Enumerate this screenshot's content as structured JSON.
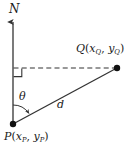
{
  "figure": {
    "background_color": "#ffffff",
    "stroke_color": "#333333",
    "text_color": "#1a1a1a",
    "width": 138,
    "height": 150
  },
  "labels": {
    "north": {
      "text": "N",
      "name": "north-direction-label"
    },
    "point_q": {
      "symbol": "Q",
      "open_paren": "(",
      "x_var": "x",
      "x_sub": "Q",
      "comma": ", ",
      "y_var": "y",
      "y_sub": "Q",
      "close_paren": ")",
      "full_text": "Q(xQ, yQ)"
    },
    "point_p": {
      "symbol": "P",
      "open_paren": "(",
      "x_var": "x",
      "x_sub": "P",
      "comma": ", ",
      "y_var": "y",
      "y_sub": "P",
      "close_paren": ")",
      "full_text": "P(xP, yP)"
    },
    "angle": {
      "text": "θ",
      "name": "bearing-angle-theta"
    },
    "distance": {
      "text": "d",
      "name": "distance-d"
    }
  },
  "geometry": {
    "point_p": {
      "x": 13,
      "y": 124
    },
    "point_q": {
      "x": 117,
      "y": 68
    },
    "north_axis": {
      "x": 13,
      "y_top": 20,
      "y_bottom": 124
    },
    "dashed_line": {
      "x1": 13,
      "y1": 68,
      "x2": 117,
      "y2": 68
    },
    "right_angle_marker": {
      "x": 13,
      "y": 68,
      "size": 8
    },
    "angle_arc_radius": 19
  }
}
